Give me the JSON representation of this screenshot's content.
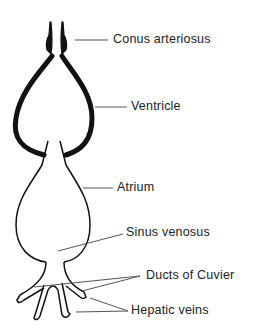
{
  "diagram": {
    "labels": [
      {
        "id": "conus",
        "text": "Conus arteriosus"
      },
      {
        "id": "ventricle",
        "text": "Ventricle"
      },
      {
        "id": "atrium",
        "text": "Atrium"
      },
      {
        "id": "sinus",
        "text": "Sinus venosus"
      },
      {
        "id": "ducts",
        "text": "Ducts of Cuvier"
      },
      {
        "id": "hepatic",
        "text": "Hepatic veins"
      }
    ],
    "colors": {
      "line": "#111111",
      "leader": "#555555",
      "text": "#222222",
      "background": "#ffffff"
    }
  }
}
